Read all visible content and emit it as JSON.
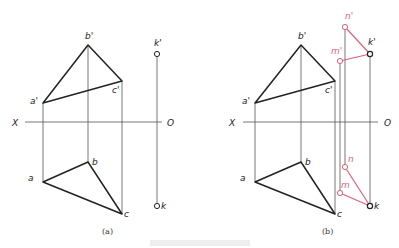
{
  "colors": {
    "line": "#222222",
    "thin": "#555555",
    "red": "#e0607a",
    "background": "#ffffff"
  },
  "axis": {
    "left_label": "X",
    "right_label": "O"
  },
  "figure_a": {
    "caption": "(a)",
    "points": {
      "b_prime": {
        "label": "b'",
        "x": 88,
        "y": 45
      },
      "a_prime": {
        "label": "a'",
        "x": 43,
        "y": 103
      },
      "c_prime": {
        "label": "c'",
        "x": 122,
        "y": 81
      },
      "b": {
        "label": "b",
        "x": 88,
        "y": 162
      },
      "a": {
        "label": "a",
        "x": 43,
        "y": 182
      },
      "c": {
        "label": "c",
        "x": 122,
        "y": 214
      },
      "k_prime": {
        "label": "k'",
        "x": 157,
        "y": 54
      },
      "k": {
        "label": "k",
        "x": 157,
        "y": 206
      }
    }
  },
  "figure_b": {
    "caption": "(b)",
    "points": {
      "b_prime": {
        "label": "b'",
        "x": 301,
        "y": 45
      },
      "a_prime": {
        "label": "a'",
        "x": 255,
        "y": 103
      },
      "c_prime": {
        "label": "c'",
        "x": 335,
        "y": 81
      },
      "b": {
        "label": "b",
        "x": 301,
        "y": 162
      },
      "a": {
        "label": "a",
        "x": 255,
        "y": 182
      },
      "c": {
        "label": "c",
        "x": 335,
        "y": 214
      },
      "k_prime": {
        "label": "k'",
        "x": 370,
        "y": 54
      },
      "k": {
        "label": "k",
        "x": 370,
        "y": 206
      },
      "n_prime": {
        "label": "n'",
        "x": 345,
        "y": 27
      },
      "m_prime": {
        "label": "m'",
        "x": 340,
        "y": 61
      },
      "n": {
        "label": "n",
        "x": 345,
        "y": 167
      },
      "m": {
        "label": "m",
        "x": 340,
        "y": 193
      }
    }
  }
}
